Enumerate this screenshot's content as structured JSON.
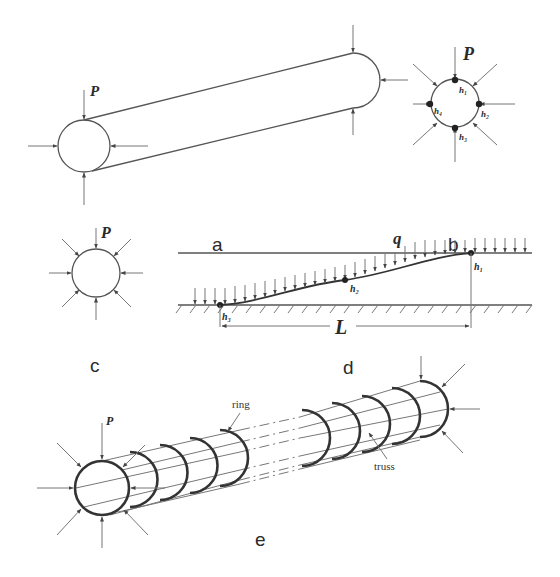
{
  "figure": {
    "panels": [
      {
        "id": "a",
        "label": "a",
        "description": "Pipe segment under external radial load"
      },
      {
        "id": "b",
        "label": "b",
        "description": "Cross-section with four measurement points"
      },
      {
        "id": "c",
        "label": "c",
        "description": "Cross-section under uniform radial pressure"
      },
      {
        "id": "d",
        "label": "d",
        "description": "Longitudinal profile with distributed load q"
      },
      {
        "id": "e",
        "label": "e",
        "description": "Ring-and-truss structural model of the pipe"
      }
    ],
    "symbols": {
      "load": "P",
      "distributed_load": "q",
      "length": "L",
      "points_b": [
        "h₁",
        "h₂",
        "h₃",
        "h₄"
      ],
      "points_d": [
        "h₁",
        "h₂",
        "h₃"
      ]
    },
    "annotations": {
      "ring": "ring",
      "truss": "truss"
    },
    "colors": {
      "line": "#555555",
      "text": "#2a2a2a",
      "background": "#ffffff"
    }
  }
}
